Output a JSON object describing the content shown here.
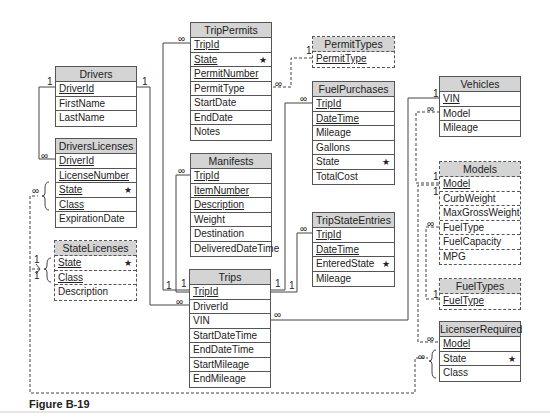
{
  "figure": {
    "caption": "Figure B-19"
  },
  "tables": {
    "drivers": {
      "title": "Drivers",
      "style": "solid",
      "fields": [
        {
          "name": "DriverId",
          "key": true,
          "star": false
        },
        {
          "name": "FirstName",
          "key": false,
          "star": false
        },
        {
          "name": "LastName",
          "key": false,
          "star": false
        }
      ]
    },
    "drivers_licenses": {
      "title": "DriversLicenses",
      "style": "solid",
      "fields": [
        {
          "name": "DriverId",
          "key": true,
          "star": false
        },
        {
          "name": "LicenseNumber",
          "key": true,
          "star": false
        },
        {
          "name": "State",
          "key": true,
          "star": true
        },
        {
          "name": "Class",
          "key": true,
          "star": false
        },
        {
          "name": "ExpirationDate",
          "key": false,
          "star": false
        }
      ]
    },
    "state_licenses": {
      "title": "StateLicenses",
      "style": "dashed",
      "fields": [
        {
          "name": "State",
          "key": true,
          "star": true
        },
        {
          "name": "Class",
          "key": true,
          "star": false
        },
        {
          "name": "Description",
          "key": false,
          "star": false
        }
      ]
    },
    "trip_permits": {
      "title": "TripPermits",
      "style": "solid",
      "fields": [
        {
          "name": "TripId",
          "key": true,
          "star": false
        },
        {
          "name": "State",
          "key": true,
          "star": true
        },
        {
          "name": "PermitNumber",
          "key": true,
          "star": false
        },
        {
          "name": "PermitType",
          "key": false,
          "star": false
        },
        {
          "name": "StartDate",
          "key": false,
          "star": false
        },
        {
          "name": "EndDate",
          "key": false,
          "star": false
        },
        {
          "name": "Notes",
          "key": false,
          "star": false
        }
      ]
    },
    "manifests": {
      "title": "Manifests",
      "style": "solid",
      "fields": [
        {
          "name": "TripId",
          "key": true,
          "star": false
        },
        {
          "name": "ItemNumber",
          "key": true,
          "star": false
        },
        {
          "name": "Description",
          "key": true,
          "star": false
        },
        {
          "name": "Weight",
          "key": false,
          "star": false
        },
        {
          "name": "Destination",
          "key": false,
          "star": false
        },
        {
          "name": "DeliveredDateTime",
          "key": false,
          "star": false
        }
      ]
    },
    "trips": {
      "title": "Trips",
      "style": "solid",
      "fields": [
        {
          "name": "TripId",
          "key": true,
          "star": false
        },
        {
          "name": "DriverId",
          "key": false,
          "star": false
        },
        {
          "name": "VIN",
          "key": false,
          "star": false
        },
        {
          "name": "StartDateTime",
          "key": false,
          "star": false
        },
        {
          "name": "EndDateTime",
          "key": false,
          "star": false
        },
        {
          "name": "StartMileage",
          "key": false,
          "star": false
        },
        {
          "name": "EndMileage",
          "key": false,
          "star": false
        }
      ]
    },
    "permit_types": {
      "title": "PermitTypes",
      "style": "dashed",
      "fields": [
        {
          "name": "PermitType",
          "key": true,
          "star": false
        }
      ]
    },
    "fuel_purchases": {
      "title": "FuelPurchases",
      "style": "solid",
      "fields": [
        {
          "name": "TripId",
          "key": true,
          "star": false
        },
        {
          "name": "DateTime",
          "key": true,
          "star": false
        },
        {
          "name": "Mileage",
          "key": false,
          "star": false
        },
        {
          "name": "Gallons",
          "key": false,
          "star": false
        },
        {
          "name": "State",
          "key": false,
          "star": true
        },
        {
          "name": "TotalCost",
          "key": false,
          "star": false
        }
      ]
    },
    "trip_state_entries": {
      "title": "TripStateEntries",
      "style": "solid",
      "fields": [
        {
          "name": "TripId",
          "key": true,
          "star": false
        },
        {
          "name": "DateTime",
          "key": true,
          "star": false
        },
        {
          "name": "EnteredState",
          "key": false,
          "star": true
        },
        {
          "name": "Mileage",
          "key": false,
          "star": false
        }
      ]
    },
    "vehicles": {
      "title": "Vehicles",
      "style": "solid",
      "fields": [
        {
          "name": "VIN",
          "key": true,
          "star": false
        },
        {
          "name": "Model",
          "key": false,
          "star": false
        },
        {
          "name": "Mileage",
          "key": false,
          "star": false
        }
      ]
    },
    "models": {
      "title": "Models",
      "style": "dashed",
      "fields": [
        {
          "name": "Model",
          "key": true,
          "star": false
        },
        {
          "name": "CurbWeight",
          "key": false,
          "star": false
        },
        {
          "name": "MaxGrossWeight",
          "key": false,
          "star": false
        },
        {
          "name": "FuelType",
          "key": false,
          "star": false
        },
        {
          "name": "FuelCapacity",
          "key": false,
          "star": false
        },
        {
          "name": "MPG",
          "key": false,
          "star": false
        }
      ]
    },
    "fuel_types": {
      "title": "FuelTypes",
      "style": "dashed",
      "fields": [
        {
          "name": "FuelType",
          "key": true,
          "star": false
        }
      ]
    },
    "licenser_required": {
      "title": "LicenserRequired",
      "style": "solid",
      "fields": [
        {
          "name": "Model",
          "key": true,
          "star": false
        },
        {
          "name": "State",
          "key": false,
          "star": true
        },
        {
          "name": "Class",
          "key": false,
          "star": false
        }
      ]
    }
  },
  "symbols": {
    "one": "1",
    "many": "∞",
    "star": "★"
  },
  "relationships": [
    {
      "from": "Drivers.DriverId",
      "to": "DriversLicenses.DriverId",
      "from_card": "1",
      "to_card": "∞",
      "style": "solid"
    },
    {
      "from": "Drivers.DriverId",
      "to": "Trips.DriverId",
      "from_card": "1",
      "to_card": "∞",
      "style": "solid"
    },
    {
      "from": "Trips.TripId",
      "to": "TripPermits.TripId",
      "from_card": "1",
      "to_card": "∞",
      "style": "solid"
    },
    {
      "from": "Trips.TripId",
      "to": "Manifests.TripId",
      "from_card": "1",
      "to_card": "∞",
      "style": "solid"
    },
    {
      "from": "Trips.TripId",
      "to": "FuelPurchases.TripId",
      "from_card": "1",
      "to_card": "∞",
      "style": "solid"
    },
    {
      "from": "Trips.TripId",
      "to": "TripStateEntries.TripId",
      "from_card": "1",
      "to_card": "∞",
      "style": "solid"
    },
    {
      "from": "Vehicles.VIN",
      "to": "Trips.VIN",
      "from_card": "1",
      "to_card": "∞",
      "style": "solid"
    },
    {
      "from": "PermitTypes.PermitType",
      "to": "TripPermits.PermitType",
      "from_card": "1",
      "to_card": "∞",
      "style": "dashed"
    },
    {
      "from": "Models.Model",
      "to": "Vehicles.Model",
      "from_card": "1",
      "to_card": "∞",
      "style": "dashed"
    },
    {
      "from": "Models.Model",
      "to": "LicenserRequired.Model",
      "from_card": "1",
      "to_card": "∞",
      "style": "dashed"
    },
    {
      "from": "FuelTypes.FuelType",
      "to": "Models.FuelType",
      "from_card": "1",
      "to_card": "∞",
      "style": "dashed"
    },
    {
      "from": "StateLicenses.(State,Class)",
      "to": "DriversLicenses.(State,Class)",
      "from_card": "1",
      "to_card": "∞",
      "style": "dashed"
    },
    {
      "from": "StateLicenses.(State,Class)",
      "to": "LicenserRequired.(State,Class)",
      "from_card": "1",
      "to_card": "∞",
      "style": "dashed"
    }
  ]
}
